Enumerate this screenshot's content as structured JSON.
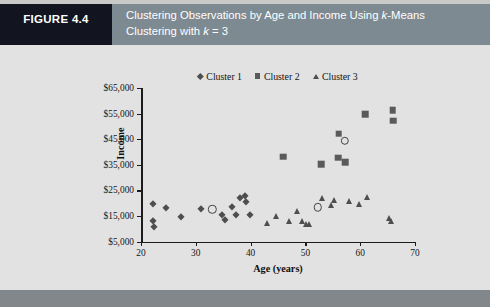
{
  "figure": {
    "tag": "FIGURE 4.4",
    "title_line_1_pre": "Clustering Observations by Age and Income Using ",
    "title_line_1_italic": "k",
    "title_line_1_post": "-Means",
    "title_line_2_pre": "Clustering with ",
    "title_line_2_italic": "k",
    "title_line_2_post": " = 3"
  },
  "colors": {
    "tag_background": "#121520",
    "title_background": "#7e8a91",
    "figure_background": "#e2e2e2",
    "bottom_strip": "#82878b",
    "marker_cluster1": "#4e4e4e",
    "marker_cluster2": "#5a5a5a",
    "marker_cluster3": "#4e4e4e",
    "centroid_outline": "#444444",
    "axis": "#1c1c1c"
  },
  "chart_data": {
    "type": "scatter",
    "title": "",
    "xlabel": "Age (years)",
    "ylabel": "Income",
    "xlim": [
      20,
      70
    ],
    "ylim": [
      5000,
      65000
    ],
    "xticks": [
      20,
      30,
      40,
      50,
      60,
      70
    ],
    "xticklabels": [
      "20",
      "30",
      "40",
      "50",
      "60",
      "70"
    ],
    "yticks": [
      5000,
      15000,
      25000,
      35000,
      45000,
      55000,
      65000
    ],
    "yticklabels": [
      "$5,000",
      "$15,000",
      "$25,000",
      "$35,000",
      "$45,000",
      "$55,000",
      "$65,000"
    ],
    "grid": false,
    "legend_position": "top-center",
    "series": [
      {
        "name": "Cluster 1",
        "marker": "diamond",
        "color": "#4e4e4e",
        "points": [
          [
            22.1,
            19800
          ],
          [
            22.2,
            13200
          ],
          [
            22.3,
            10600
          ],
          [
            24.6,
            17900
          ],
          [
            27.3,
            14700
          ],
          [
            30.9,
            17800
          ],
          [
            34.7,
            15200
          ],
          [
            35.4,
            13300
          ],
          [
            36.6,
            18300
          ],
          [
            37.3,
            15400
          ],
          [
            38.0,
            22100
          ],
          [
            38.9,
            22900
          ],
          [
            39.1,
            20600
          ],
          [
            39.8,
            15300
          ]
        ]
      },
      {
        "name": "Cluster 2",
        "marker": "square",
        "color": "#5a5a5a",
        "points": [
          [
            45.9,
            38200
          ],
          [
            52.9,
            35300
          ],
          [
            56.0,
            37800
          ],
          [
            56.1,
            47200
          ],
          [
            57.3,
            35900
          ],
          [
            60.9,
            54800
          ],
          [
            65.9,
            56400
          ],
          [
            66.0,
            52200
          ]
        ]
      },
      {
        "name": "Cluster 3",
        "marker": "triangle",
        "color": "#4e4e4e",
        "points": [
          [
            43.0,
            12100
          ],
          [
            44.6,
            15100
          ],
          [
            47.0,
            12900
          ],
          [
            48.5,
            17100
          ],
          [
            49.3,
            13100
          ],
          [
            50.1,
            11900
          ],
          [
            50.7,
            11900
          ],
          [
            53.0,
            22000
          ],
          [
            54.7,
            19300
          ],
          [
            55.2,
            21300
          ],
          [
            58.0,
            20900
          ],
          [
            59.7,
            19800
          ],
          [
            61.2,
            22300
          ],
          [
            65.3,
            14100
          ],
          [
            65.6,
            12900
          ]
        ]
      },
      {
        "name": "Centroids",
        "marker": "open-circle",
        "color": "#444444",
        "points": [
          [
            33.0,
            17600
          ],
          [
            52.3,
            18400
          ],
          [
            57.2,
            44300
          ]
        ]
      }
    ],
    "legend_entries": [
      {
        "label": "Cluster 1",
        "marker": "diamond"
      },
      {
        "label": "Cluster 2",
        "marker": "square"
      },
      {
        "label": "Cluster 3",
        "marker": "triangle"
      }
    ]
  }
}
